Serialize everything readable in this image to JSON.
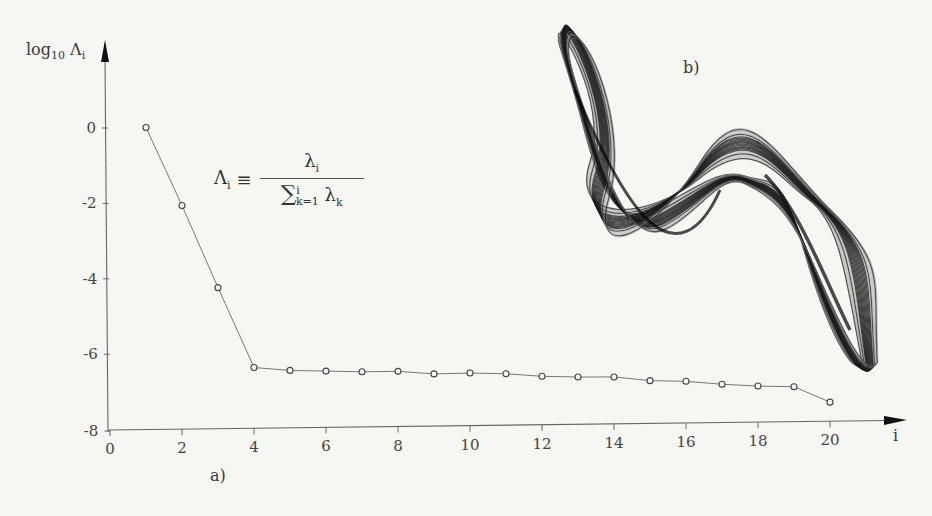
{
  "chart_data": [
    {
      "type": "line",
      "panel": "a)",
      "title": "",
      "xlabel": "i",
      "ylabel": "log10 Λi",
      "xlim": [
        0,
        21.5
      ],
      "ylim": [
        -8,
        1.5
      ],
      "xticks": [
        0,
        2,
        4,
        6,
        8,
        10,
        12,
        14,
        16,
        18,
        20
      ],
      "yticks": [
        0,
        -2,
        -4,
        -6,
        -8
      ],
      "grid": false,
      "marker": "open-circle",
      "annotation": "Λi ≡ λi / Σ_{k=1}^{i} λk",
      "x": [
        1,
        2,
        3,
        4,
        5,
        6,
        7,
        8,
        9,
        10,
        11,
        12,
        13,
        14,
        15,
        16,
        17,
        18,
        19,
        20
      ],
      "values": [
        0.0,
        -2.08,
        -4.27,
        -6.4,
        -6.49,
        -6.52,
        -6.55,
        -6.55,
        -6.63,
        -6.62,
        -6.65,
        -6.73,
        -6.76,
        -6.77,
        -6.88,
        -6.91,
        -7.0,
        -7.06,
        -7.09,
        -7.51
      ]
    },
    {
      "type": "scatter",
      "panel": "b)",
      "title": "",
      "description": "Phase-space plot of a chaotic attractor (dense trajectory bands)"
    }
  ],
  "labels": {
    "ylabel_main": "log",
    "ylabel_sub": "10",
    "ylabel_sym": " Λ",
    "ylabel_sym_sub": "i",
    "xlabel": "i",
    "panel_a": "a)",
    "panel_b": "b)",
    "formula_lhs": "Λ",
    "formula_lhs_sub": "i",
    "formula_eq": " ≡ ",
    "formula_num": "λ",
    "formula_num_sub": "i",
    "formula_sum": "∑",
    "formula_sum_sup": "i",
    "formula_sum_sub": "k=1",
    "formula_den": " λ",
    "formula_den_sub": "k"
  }
}
